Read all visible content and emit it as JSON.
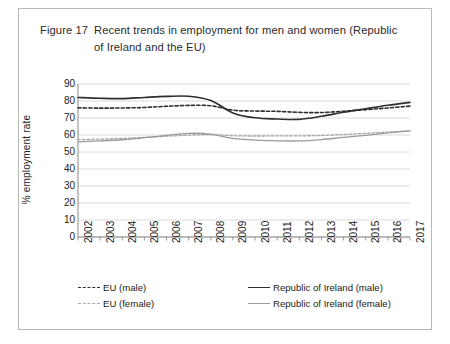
{
  "figure": {
    "label": "Figure 17",
    "caption": "Recent trends in employment for men and women (Republic of Ireland and the EU)"
  },
  "chart_data": {
    "type": "line",
    "title": "Recent trends in employment for men and women (Republic of Ireland and the EU)",
    "xlabel": "",
    "ylabel": "% employment rate",
    "ylim": [
      0,
      90
    ],
    "ytick_step": 10,
    "yticks": [
      90,
      80,
      70,
      60,
      50,
      40,
      30,
      20,
      10,
      0
    ],
    "grid": true,
    "legend_position": "bottom",
    "x": [
      2002,
      2003,
      2004,
      2005,
      2006,
      2007,
      2008,
      2009,
      2010,
      2011,
      2012,
      2013,
      2014,
      2015,
      2016,
      2017
    ],
    "categories": [
      "2002",
      "2003",
      "2004",
      "2005",
      "2006",
      "2007",
      "2008",
      "2009",
      "2010",
      "2011",
      "2012",
      "2013",
      "2014",
      "2015",
      "2016",
      "2017"
    ],
    "series": [
      {
        "name": "Republic of Ireland (male)",
        "style": "solid",
        "color": "#2e2e2e",
        "values": [
          82.1,
          81.6,
          81.4,
          82.1,
          82.7,
          82.8,
          80.3,
          73.0,
          70.1,
          69.4,
          69.2,
          71.0,
          73.4,
          75.4,
          77.5,
          79.2
        ]
      },
      {
        "name": "EU (male)",
        "style": "dashed",
        "color": "#2e2e2e",
        "values": [
          76.0,
          75.8,
          75.9,
          76.2,
          76.9,
          77.4,
          77.2,
          74.6,
          74.1,
          73.9,
          73.3,
          73.2,
          74.0,
          74.9,
          75.9,
          77.0
        ]
      },
      {
        "name": "Republic of Ireland (female)",
        "style": "solid",
        "color": "#9a9a9a",
        "values": [
          56.0,
          56.6,
          57.2,
          58.4,
          59.8,
          61.0,
          60.5,
          58.0,
          57.0,
          56.6,
          56.5,
          57.3,
          58.6,
          59.8,
          61.2,
          62.4
        ]
      },
      {
        "name": "EU (female)",
        "style": "dashed",
        "color": "#a8a8a8",
        "values": [
          57.3,
          57.6,
          58.0,
          58.6,
          59.3,
          59.9,
          60.2,
          59.6,
          59.4,
          59.5,
          59.5,
          59.7,
          60.3,
          61.0,
          61.7,
          62.5
        ]
      }
    ]
  },
  "legend": {
    "items": [
      {
        "label": "EU (male)",
        "style": "dash-dark"
      },
      {
        "label": "Republic of Ireland (male)",
        "style": "solid-dark"
      },
      {
        "label": "EU (female)",
        "style": "dash-light"
      },
      {
        "label": "Republic of Ireland (female)",
        "style": "solid-light"
      }
    ]
  }
}
